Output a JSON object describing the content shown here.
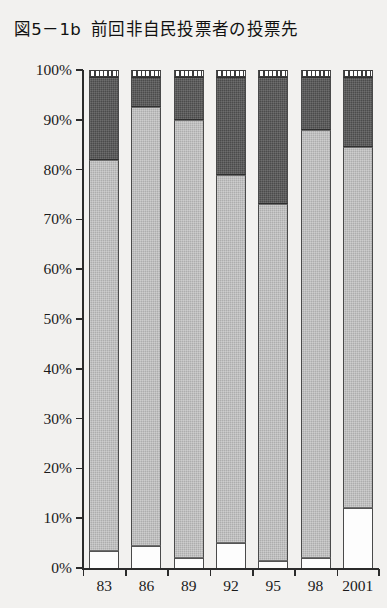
{
  "figure": {
    "title_number": "図5－1b",
    "title_text": "前回非自民投票者の投票先",
    "title_full": "図5－1b　前回非自民投票者の投票先"
  },
  "chart_data": {
    "type": "bar",
    "subtype": "stacked-percentage",
    "xlabel": "",
    "ylabel": "",
    "ylim": [
      0,
      100
    ],
    "y_ticks": [
      0,
      10,
      20,
      30,
      40,
      50,
      60,
      70,
      80,
      90,
      100
    ],
    "y_tick_labels": [
      "0%",
      "10%",
      "20%",
      "30%",
      "40%",
      "50%",
      "60%",
      "70%",
      "80%",
      "90%",
      "100%"
    ],
    "grid": false,
    "legend": "none",
    "categories": [
      "83",
      "86",
      "89",
      "92",
      "95",
      "98",
      "2001"
    ],
    "series": [
      {
        "name": "base-white",
        "style": "white",
        "values": [
          3.5,
          4.5,
          2.0,
          5.0,
          1.5,
          2.0,
          12.0
        ]
      },
      {
        "name": "body-light-gray",
        "style": "light-gray",
        "values": [
          78.5,
          88.0,
          88.0,
          74.0,
          71.5,
          86.0,
          72.5
        ]
      },
      {
        "name": "middle-dark-gray",
        "style": "dark-gray",
        "values": [
          16.5,
          6.0,
          8.5,
          19.5,
          25.5,
          10.5,
          14.0
        ]
      },
      {
        "name": "top-hatched",
        "style": "hatched",
        "values": [
          1.5,
          1.5,
          1.5,
          1.5,
          1.5,
          1.5,
          1.5
        ]
      }
    ]
  },
  "colors": {
    "background": "#f2f1ef",
    "axis": "#2b2b2b",
    "text": "#1a1a1a",
    "light_gray": "#adadad",
    "dark_gray": "#4b4b4b",
    "white": "#fdfdfd"
  }
}
